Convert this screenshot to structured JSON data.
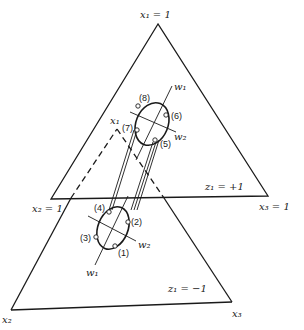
{
  "diagram": {
    "type": "two stacked ternary simplex planes (x1, x2, x3) with ellipse regions and rotated axes",
    "upper_plane": {
      "label": "z₁ = +1",
      "vertices": {
        "top": "x₁ = 1",
        "left": "x₂ = 1",
        "right": "x₃ = 1"
      },
      "points": [
        "(5)",
        "(6)",
        "(7)",
        "(8)"
      ],
      "axes": [
        "w₁",
        "w₂"
      ]
    },
    "lower_plane": {
      "label": "z₁ = −1",
      "vertices": {
        "top": "x₁",
        "left": "x₂",
        "right": "x₃"
      },
      "points": [
        "(1)",
        "(2)",
        "(3)",
        "(4)"
      ],
      "axes": [
        "w₁",
        "w₂"
      ]
    }
  },
  "colors": {
    "line": "#1a1a1a",
    "background": "#ffffff"
  }
}
